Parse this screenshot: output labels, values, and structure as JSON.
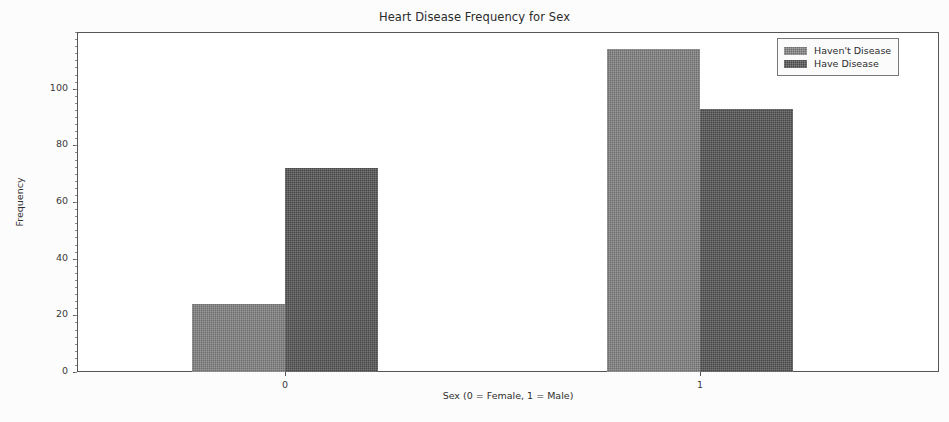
{
  "chart_data": {
    "type": "bar",
    "title": "Heart Disease Frequency for Sex",
    "xlabel": "Sex (0 = Female, 1 = Male)",
    "ylabel": "Frequency",
    "categories": [
      "0",
      "1"
    ],
    "series": [
      {
        "name": "Haven't Disease",
        "values": [
          24,
          114
        ],
        "color": "#6d6d6d"
      },
      {
        "name": "Have Disease",
        "values": [
          72,
          93
        ],
        "color": "#484848"
      }
    ],
    "ylim": [
      0,
      120
    ],
    "yticks": [
      0,
      20,
      40,
      60,
      80,
      100
    ],
    "ytick_labels": [
      "0",
      "20",
      "40",
      "60",
      "80",
      "100"
    ],
    "xticks": [
      0,
      1
    ],
    "xtick_labels": [
      "0",
      "1"
    ],
    "grid": false,
    "legend_position": "upper right",
    "bar_style": "grouped",
    "background_color": "#ffffff",
    "axis_color": "#555555"
  },
  "legend": {
    "items": [
      {
        "label": "Haven't Disease"
      },
      {
        "label": "Have Disease"
      }
    ]
  }
}
